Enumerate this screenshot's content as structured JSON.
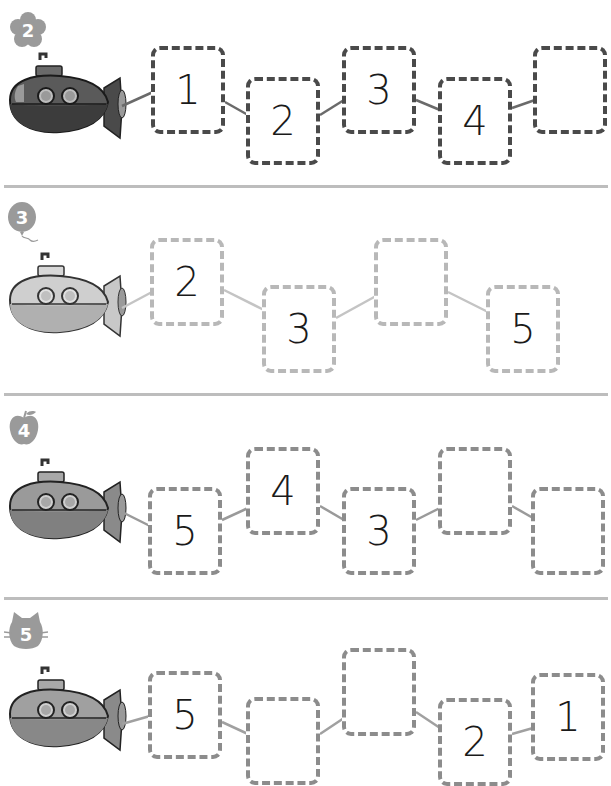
{
  "worksheet": {
    "rows": [
      {
        "badge": {
          "number": "2",
          "shape": "flower-icon"
        },
        "tone": "dark",
        "sub_color": "#555555",
        "sub_top_color": "#5e5e5e",
        "sub_bottom_color": "#3a3a3a",
        "line_color": "#6a6a6a",
        "boxes": [
          {
            "value": "1",
            "x": 151,
            "y": 46
          },
          {
            "value": "2",
            "x": 246,
            "y": 77
          },
          {
            "value": "3",
            "x": 342,
            "y": 46
          },
          {
            "value": "4",
            "x": 438,
            "y": 77
          },
          {
            "value": "",
            "x": 533,
            "y": 46
          }
        ]
      },
      {
        "badge": {
          "number": "3",
          "shape": "balloon-icon"
        },
        "tone": "light",
        "sub_color": "#bdbdbd",
        "sub_top_color": "#c8c8c8",
        "sub_bottom_color": "#a8a8a8",
        "line_color": "#c4c4c4",
        "boxes": [
          {
            "value": "2",
            "x": 150,
            "y": 238
          },
          {
            "value": "3",
            "x": 262,
            "y": 285
          },
          {
            "value": "",
            "x": 374,
            "y": 238
          },
          {
            "value": "5",
            "x": 486,
            "y": 285
          }
        ]
      },
      {
        "badge": {
          "number": "4",
          "shape": "apple-icon"
        },
        "tone": "mid",
        "sub_color": "#8f8f8f",
        "sub_top_color": "#9a9a9a",
        "sub_bottom_color": "#7e7e7e",
        "line_color": "#9a9a9a",
        "boxes": [
          {
            "value": "5",
            "x": 148,
            "y": 487
          },
          {
            "value": "4",
            "x": 246,
            "y": 447
          },
          {
            "value": "3",
            "x": 342,
            "y": 487
          },
          {
            "value": "",
            "x": 438,
            "y": 447
          },
          {
            "value": "",
            "x": 531,
            "y": 487
          }
        ]
      },
      {
        "badge": {
          "number": "5",
          "shape": "cat-icon"
        },
        "tone": "mid",
        "sub_color": "#9a9a9a",
        "sub_top_color": "#a4a4a4",
        "sub_bottom_color": "#888888",
        "line_color": "#a0a0a0",
        "boxes": [
          {
            "value": "5",
            "x": 148,
            "y": 671
          },
          {
            "value": "",
            "x": 246,
            "y": 697
          },
          {
            "value": "",
            "x": 342,
            "y": 648
          },
          {
            "value": "2",
            "x": 438,
            "y": 698
          },
          {
            "value": "1",
            "x": 531,
            "y": 673
          }
        ]
      }
    ],
    "separators_y": [
      185,
      393,
      597
    ]
  }
}
